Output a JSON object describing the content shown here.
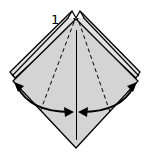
{
  "diagram": {
    "type": "origami-step",
    "step_number": "1",
    "colors": {
      "paper_fill": "#d4d4d4",
      "back_layer_fill": "#e2e2e2",
      "outline": "#000000",
      "background": "#ffffff"
    },
    "elements": {
      "main_diamond": "kite-shaped folded square with gray fill",
      "back_layers": "two offset back flaps visible at top and sides",
      "center_line": "vertical solid crease line",
      "valley_folds": [
        "left dashed crease",
        "right dashed crease"
      ],
      "arrows": [
        "left fold arrow toward center",
        "right fold arrow toward center"
      ]
    }
  }
}
